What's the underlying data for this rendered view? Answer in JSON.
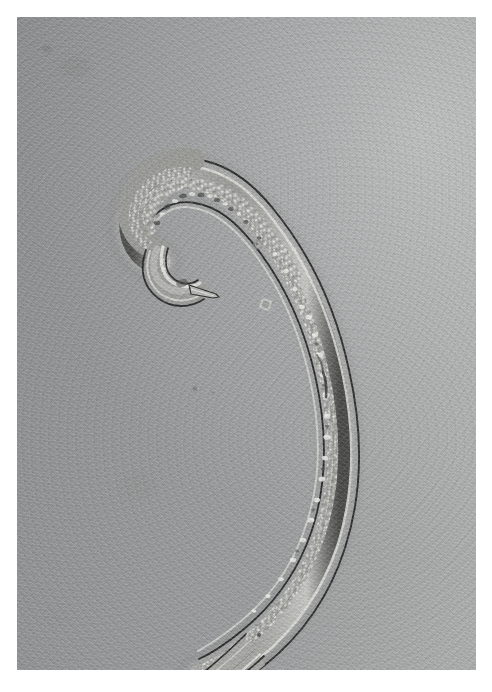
{
  "figure": {
    "domain_label": "light-microscope photomicrograph",
    "caption": "",
    "width_px": 492,
    "height_px": 692
  },
  "plate": {
    "name": "micrograph-plate",
    "left_px": 17,
    "top_px": 17,
    "width_px": 459,
    "height_px": 653,
    "paper_margin_color": "#ffffff",
    "field_color_dark": "#8f9092",
    "field_color_light": "#afb0b0",
    "illumination": "brightfield, gradient brighter toward upper right"
  },
  "specimen": {
    "organism": "nematode",
    "posture": "C-shaped / question-mark, head curled into a tight ventral hook",
    "orientation": "head upper-left, tail lower-left, body arcs over the top and down the right side",
    "cuticle_outline_color": "#3b3b3b",
    "cuticle_highlight_color": "#d8d8d6",
    "body_fill_color": "#a5a5a3",
    "gut_granule_color": "#e2e2df",
    "parts": [
      {
        "label": "head-hook",
        "note": "anterior end curled into a closed hook at upper left"
      },
      {
        "label": "mouth-tip",
        "note": "small pointed anterior tip directed to the right inside the hook"
      },
      {
        "label": "body-arc",
        "note": "long tapering trunk sweeping right then down"
      },
      {
        "label": "intestine",
        "note": "granular internal gut column visible through the cuticle"
      },
      {
        "label": "tail-tip",
        "note": "tapering pointed tail at lower left"
      }
    ]
  },
  "debris": [
    {
      "name": "debris-particle-1",
      "cx_px": 241,
      "cy_px": 228,
      "r_px": 5
    },
    {
      "name": "debris-particle-2",
      "cx_px": 249,
      "cy_px": 288,
      "r_px": 6
    },
    {
      "name": "debris-particle-3",
      "cx_px": 268,
      "cy_px": 234,
      "r_px": 2
    },
    {
      "name": "debris-particle-4",
      "cx_px": 178,
      "cy_px": 372,
      "r_px": 3
    },
    {
      "name": "debris-smudge-1",
      "cx_px": 58,
      "cy_px": 50,
      "r_px": 14
    }
  ]
}
